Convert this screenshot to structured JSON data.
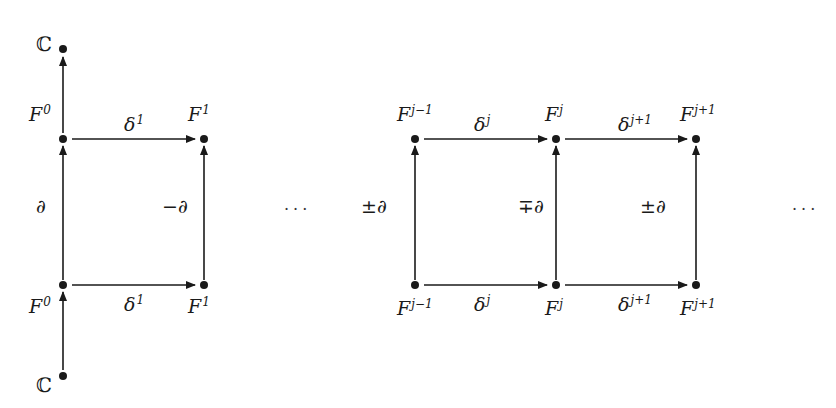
{
  "diagram": {
    "type": "commutative-diagram",
    "left_block": {
      "top_aug": {
        "label": "ℂ"
      },
      "bottom_aug": {
        "label": "ℂ"
      },
      "top_row": [
        {
          "base": "F",
          "sup": "0"
        },
        {
          "base": "F",
          "sup": "1"
        }
      ],
      "bottom_row": [
        {
          "base": "F",
          "sup": "0"
        },
        {
          "base": "F",
          "sup": "1"
        }
      ],
      "top_arrow": {
        "base": "δ",
        "sup": "1"
      },
      "bottom_arrow": {
        "base": "δ",
        "sup": "1"
      },
      "left_vertical": "∂",
      "right_vertical": "−∂"
    },
    "ellipsis_middle": "···",
    "ellipsis_right": "···",
    "right_block": {
      "top_row": [
        {
          "base": "F",
          "sup": "j−1"
        },
        {
          "base": "F",
          "sup": "j"
        },
        {
          "base": "F",
          "sup": "j+1"
        }
      ],
      "bottom_row": [
        {
          "base": "F",
          "sup": "j−1"
        },
        {
          "base": "F",
          "sup": "j"
        },
        {
          "base": "F",
          "sup": "j+1"
        }
      ],
      "top_arrows": [
        {
          "base": "δ",
          "sup": "j"
        },
        {
          "base": "δ",
          "sup": "j+1"
        }
      ],
      "bottom_arrows": [
        {
          "base": "δ",
          "sup": "j"
        },
        {
          "base": "δ",
          "sup": "j+1"
        }
      ],
      "verticals": [
        "±∂",
        "∓∂",
        "±∂"
      ]
    }
  }
}
